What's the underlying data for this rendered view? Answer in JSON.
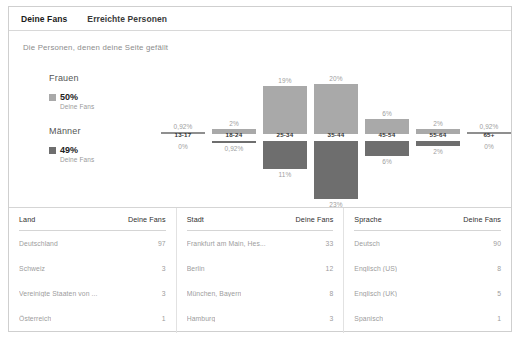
{
  "tabs": [
    {
      "label": "Deine Fans",
      "active": true
    },
    {
      "label": "Erreichte Personen",
      "active": false
    }
  ],
  "subtitle": "Die Personen, denen deine Seite gefällt",
  "legend": {
    "female": {
      "title": "Frauen",
      "percent": "50%",
      "sub": "Deine Fans",
      "color": "#a9a9a9"
    },
    "male": {
      "title": "Männer",
      "percent": "49%",
      "sub": "Deine Fans",
      "color": "#6e6e6e"
    }
  },
  "chart_data": {
    "type": "bar",
    "title": "Die Personen, denen deine Seite gefällt",
    "xlabel": "",
    "ylabel": "",
    "orientation": "diverging-vertical",
    "categories": [
      "13-17",
      "18-24",
      "25-34",
      "35-44",
      "45-54",
      "55-64",
      "65+"
    ],
    "series": [
      {
        "name": "Frauen",
        "color": "#a9a9a9",
        "values": [
          0.92,
          2,
          19,
          20,
          6,
          2,
          0.92
        ],
        "labels": [
          "0,92%",
          "2%",
          "19%",
          "20%",
          "6%",
          "2%",
          "0,92%"
        ]
      },
      {
        "name": "Männer",
        "color": "#6e6e6e",
        "values": [
          0,
          0.92,
          11,
          23,
          6,
          2,
          0
        ],
        "labels": [
          "0%",
          "0,92%",
          "11%",
          "23%",
          "6%",
          "2%",
          "0%"
        ]
      }
    ],
    "ylim": [
      0,
      25
    ],
    "grid": false,
    "legend_position": "left"
  },
  "tables": [
    {
      "header_name": "Land",
      "header_value": "Deine Fans",
      "rows": [
        {
          "name": "Deutschland",
          "value": "97"
        },
        {
          "name": "Schweiz",
          "value": "3"
        },
        {
          "name": "Vereinigte Staaten von ...",
          "value": "3"
        },
        {
          "name": "Österreich",
          "value": "1"
        }
      ]
    },
    {
      "header_name": "Stadt",
      "header_value": "Deine Fans",
      "rows": [
        {
          "name": "Frankfurt am Main, Hes...",
          "value": "33"
        },
        {
          "name": "Berlin",
          "value": "12"
        },
        {
          "name": "München, Bayern",
          "value": "8"
        },
        {
          "name": "Hamburg",
          "value": "3"
        }
      ]
    },
    {
      "header_name": "Sprache",
      "header_value": "Deine Fans",
      "rows": [
        {
          "name": "Deutsch",
          "value": "90"
        },
        {
          "name": "Englisch (US)",
          "value": "8"
        },
        {
          "name": "Englisch (UK)",
          "value": "5"
        },
        {
          "name": "Spanisch",
          "value": "1"
        }
      ]
    }
  ]
}
